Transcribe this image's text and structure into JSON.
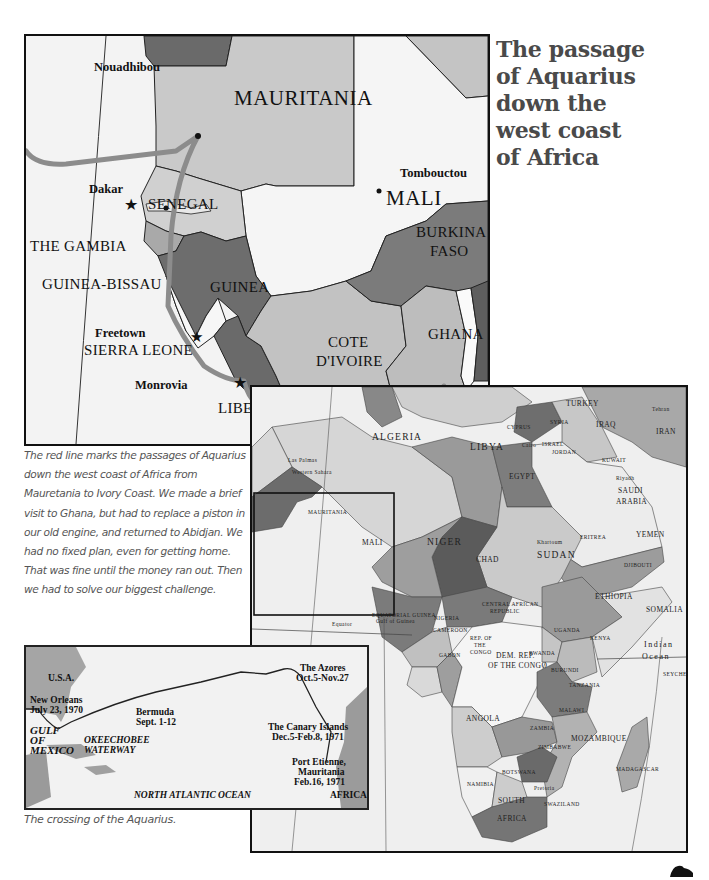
{
  "title": {
    "lines": [
      "The passage",
      "of Aquarius",
      "down the",
      "west coast",
      "of Africa"
    ]
  },
  "main_map": {
    "countries": {
      "mauritania": "MAURITANIA",
      "mali": "MALI",
      "senegal": "SENEGAL",
      "gambia": "THE GAMBIA",
      "guinea_bissau": "GUINEA-BISSAU",
      "guinea": "GUINEA",
      "burkina": "BURKINA",
      "faso": "FASO",
      "sierra_leone": "SIERRA LEONE",
      "liberia": "LIBERIA",
      "cote": "COTE",
      "divoire": "D'IVOIRE",
      "ghana": "GHANA"
    },
    "cities": {
      "nouadhibou": "Nouadhibou",
      "tombouctou": "Tombouctou",
      "dakar": "Dakar",
      "freetown": "Freetown",
      "monrovia": "Monrovia",
      "accra": "Accra",
      "abidjan": "Abidjan"
    }
  },
  "caption_main": "The red line marks the passages of Aquarius down the west coast of Africa from Mauretania to Ivory Coast. We made a brief visit to Ghana, but had to replace a piston in our old engine, and returned to Abidjan. We had no fixed plan, even for getting home. That was fine until the money ran out. Then we had to solve our biggest challenge.",
  "africa_map": {
    "labels": {
      "algeria": "ALGERIA",
      "libya": "LIBYA",
      "egypt": "EGYPT",
      "turkey": "TURKEY",
      "cyprus": "CYPRUS",
      "syria": "SYRIA",
      "iraq": "IRAQ",
      "iran": "IRAN",
      "israel": "ISRAEL",
      "jordan": "JORDAN",
      "kuwait": "KUWAIT",
      "saudi": "SAUDI",
      "arabia": "ARABIA",
      "yemen": "YEMEN",
      "niger": "NIGER",
      "chad": "CHAD",
      "sudan": "SUDAN",
      "eritrea": "ERITREA",
      "djibouti": "DJIBOUTI",
      "ethiopia": "ETHIOPIA",
      "somalia": "SOMALIA",
      "nigeria": "NIGERIA",
      "cameroon": "CAMEROON",
      "car_1": "CENTRAL AFRICAN",
      "car_2": "REPUBLIC",
      "mauritania": "MAURITANIA",
      "mali": "MALI",
      "western_sahara": "Western Sahara",
      "eq_guinea": "EQUATORIAL GUINEA",
      "gulf_guinea": "Gulf of Guinea",
      "equator": "Equator",
      "gabon": "GABON",
      "rep_congo_1": "REP. OF",
      "rep_congo_2": "THE",
      "rep_congo_3": "CONGO",
      "drc_1": "DEM. REP.",
      "drc_2": "OF THE CONGO",
      "uganda": "UGANDA",
      "kenya": "KENYA",
      "rwanda": "RWANDA",
      "burundi": "BURUNDI",
      "tanzania": "TANZANIA",
      "angola": "ANGOLA",
      "zambia": "ZAMBIA",
      "malawi": "MALAWI",
      "zimbabwe": "ZIMBABWE",
      "mozambique": "MOZAMBIQUE",
      "namibia": "NAMIBIA",
      "botswana": "BOTSWANA",
      "south": "SOUTH",
      "africa": "AFRICA",
      "swaziland": "SWAZILAND",
      "madagascar": "MADAGASCAR",
      "indian": "Indian",
      "ocean": "Ocean",
      "seychelles": "SEYCHE",
      "tehran": "Tehran",
      "riyadh": "Riyadh",
      "khartoum": "Khartoum",
      "cairo": "Cairo",
      "pretoria": "Pretoria",
      "las_palmas": "Las Palmas"
    }
  },
  "atlantic_map": {
    "labels": {
      "usa": "U.S.A.",
      "new_orleans_1": "New Orleans",
      "new_orleans_2": "July 23, 1970",
      "gulf_1": "GULF",
      "gulf_2": "OF",
      "gulf_3": "MEXICO",
      "okeechobee_1": "OKEECHOBEE",
      "okeechobee_2": "WATERWAY",
      "bermuda_1": "Bermuda",
      "bermuda_2": "Sept. 1-12",
      "azores_1": "The Azores",
      "azores_2": "Oct.5-Nov.27",
      "canary_1": "The Canary Islands",
      "canary_2": "Dec.5-Feb.8, 1971",
      "port_1": "Port Etienne,",
      "port_2": "Mauritania",
      "port_3": "Feb.16, 1971",
      "ocean": "NORTH ATLANTIC OCEAN",
      "africa": "AFRICA"
    }
  },
  "caption_atlantic": "The crossing of the Aquarius.",
  "colors": {
    "route": "#8a8a8a",
    "country_dark": "#6f6f6f",
    "country_mid": "#9a9a9a",
    "country_light": "#c8c8c8",
    "land_pale": "#e6e6e6",
    "title": "#4a4a4a"
  }
}
